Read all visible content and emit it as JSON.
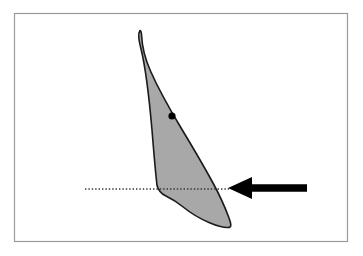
{
  "figure": {
    "title": "Outline diagram with reference line and indicator arrow",
    "canvas": {
      "width": 363,
      "height": 256,
      "background_color": "#ffffff"
    },
    "frame": {
      "name": "figure-border",
      "x": 14,
      "y": 13,
      "width": 333,
      "height": 228,
      "stroke_color": "#9a9a9a",
      "stroke_width": 1.2,
      "fill": "none"
    },
    "shape": {
      "label": "blade-outline",
      "description": "Elongated tapering blade-like outline, pointed at top, concave notch at lower left, pointed tail at lower right",
      "fill_color": "#a8a8a8",
      "stroke_color": "#1a1a1a",
      "stroke_width": 1.6,
      "path": "M 140.0 30.5 C 137.5 34.0 138.8 41.0 141.0 49.0 C 145.0 65.0 149.0 96.0 152.0 130.0 C 154.0 155.0 155.6 173.0 157.0 185.5 C 158.4 190.5 161.0 193.6 165.5 195.8 C 171.5 198.8 177.0 202.0 182.5 206.5 C 190.0 212.6 199.5 218.5 209.5 222.8 C 218.0 226.4 224.5 228.2 229.5 227.4 C 231.5 226.8 231.2 224.0 229.0 218.0 C 225.0 207.0 219.5 195.0 213.0 183.0 C 203.5 165.5 192.0 146.0 180.5 127.0 C 168.5 107.0 158.0 88.0 150.5 71.0 C 145.0 58.5 142.0 45.0 141.6 35.5 C 141.4 32.0 140.9 30.4 140.0 30.5 Z",
      "tip_top": [
        140,
        30
      ],
      "tip_bottom": [
        230,
        227
      ]
    },
    "point_marker": {
      "label": "reference-point",
      "cx": 172,
      "cy": 116,
      "r": 3.6,
      "color": "#000000"
    },
    "dotted_line": {
      "label": "horizontal-reference-line",
      "x1": 85,
      "x2": 229,
      "y": 189,
      "color": "#333333",
      "stroke_width": 1.4,
      "dash_pattern": "1.4 2.0"
    },
    "arrow": {
      "label": "pointer-arrow",
      "direction": "left",
      "tip_x": 228,
      "tail_x": 307,
      "y": 188,
      "shaft_thickness": 7.5,
      "head_length": 24,
      "head_half_width": 11,
      "color": "#000000"
    }
  }
}
